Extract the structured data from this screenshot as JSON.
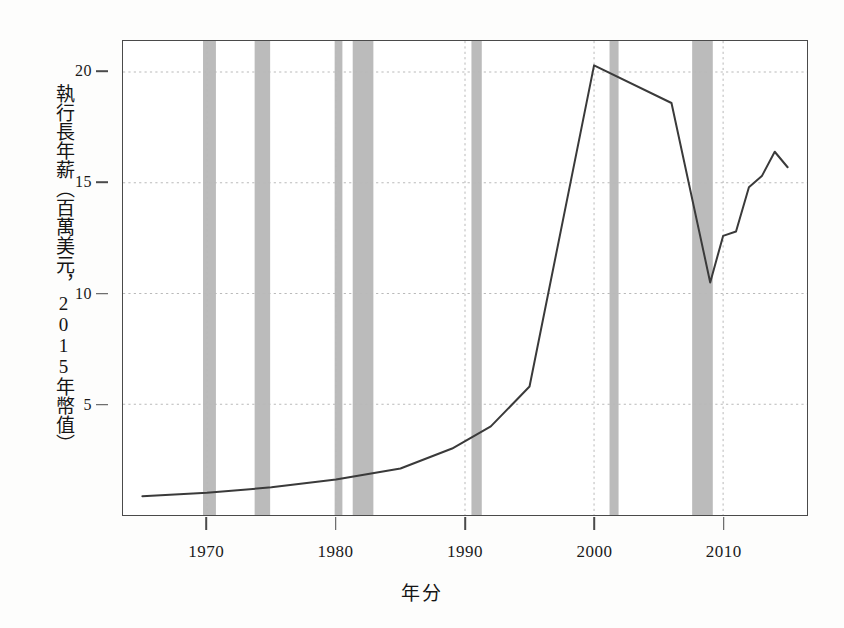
{
  "chart_data": {
    "type": "line",
    "title": "",
    "xlabel": "年分",
    "ylabel": "執行長年薪（百萬美元，2015年幣值）",
    "xlim": [
      1963.5,
      2016.5
    ],
    "ylim": [
      0.0,
      21.4
    ],
    "grid": true,
    "legend": "none",
    "x_ticks": [
      1970,
      1980,
      1990,
      2000,
      2010
    ],
    "x_tick_labels": [
      "1970",
      "1980",
      "1990",
      "2000",
      "2010"
    ],
    "y_ticks": [
      5,
      10,
      15,
      20
    ],
    "y_tick_labels": [
      "5",
      "10",
      "15",
      "20"
    ],
    "series": [
      {
        "name": "執行長年薪",
        "x": [
          1965,
          1970,
          1975,
          1980,
          1985,
          1989,
          1992,
          1995,
          2000,
          2006,
          2009,
          2010,
          2011,
          2012,
          2013,
          2014,
          2015
        ],
        "values": [
          0.85,
          1.0,
          1.25,
          1.6,
          2.1,
          3.0,
          4.0,
          5.8,
          20.3,
          18.6,
          10.5,
          12.6,
          12.8,
          14.8,
          15.3,
          16.4,
          15.7
        ]
      }
    ],
    "shaded_bands": {
      "label": "衰退期",
      "color": "#b5b5b5",
      "ranges": [
        [
          1969.7,
          1970.7
        ],
        [
          1973.7,
          1974.9
        ],
        [
          1979.9,
          1980.5
        ],
        [
          1981.3,
          1982.9
        ],
        [
          1990.5,
          1991.3
        ],
        [
          2001.2,
          2001.9
        ],
        [
          2007.6,
          2009.2
        ]
      ]
    }
  },
  "axes": {
    "y_title": "執行長年薪（百萬美元，2015年幣值）",
    "x_title": "年分"
  },
  "colors": {
    "line": "#3a3a3a",
    "band": "#b5b5b5",
    "grid": "#b9b9b9",
    "frame": "#4a4a4a",
    "background": "#ffffff"
  }
}
